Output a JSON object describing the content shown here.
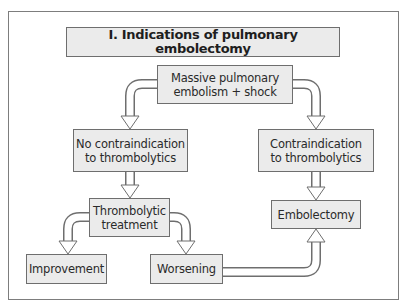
{
  "diagram": {
    "title": "I. Indications of pulmonary embolectomy",
    "nodes": {
      "start": {
        "line1": "Massive pulmonary",
        "line2": "embolism + shock"
      },
      "no_contra": {
        "line1": "No contraindication",
        "line2": "to thrombolytics"
      },
      "contra": {
        "line1": "Contraindication",
        "line2": "to thrombolytics"
      },
      "thrombolytic": {
        "line1": "Thrombolytic",
        "line2": "treatment"
      },
      "embolectomy": {
        "label": "Embolectomy"
      },
      "improvement": {
        "label": "Improvement"
      },
      "worsening": {
        "label": "Worsening"
      }
    },
    "edges": [
      {
        "from": "start",
        "to": "no_contra"
      },
      {
        "from": "start",
        "to": "contra"
      },
      {
        "from": "no_contra",
        "to": "thrombolytic"
      },
      {
        "from": "contra",
        "to": "embolectomy"
      },
      {
        "from": "thrombolytic",
        "to": "improvement"
      },
      {
        "from": "thrombolytic",
        "to": "worsening"
      },
      {
        "from": "worsening",
        "to": "embolectomy"
      }
    ],
    "colors": {
      "box_fill": "#ebebeb",
      "box_border": "#6e6e6e",
      "frame_border": "#7d7d7d",
      "text": "#2a2a2a"
    }
  }
}
